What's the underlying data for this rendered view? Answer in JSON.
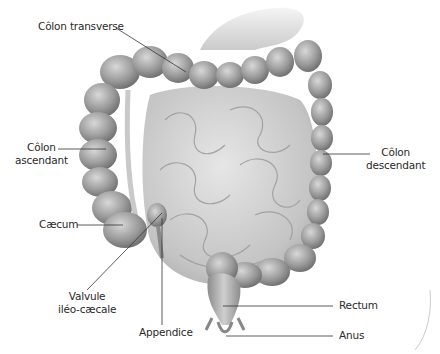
{
  "diagram": {
    "labels": {
      "colon_transverse": "Côlon transverse",
      "colon_ascendant_1": "Côlon",
      "colon_ascendant_2": "ascendant",
      "colon_descendant_1": "Côlon",
      "colon_descendant_2": "descendant",
      "caecum": "Cæcum",
      "valvule_1": "Valvule",
      "valvule_2": "iléo-cæcale",
      "appendice": "Appendice",
      "rectum": "Rectum",
      "anus": "Anus"
    },
    "colors": {
      "background": "#ffffff",
      "organ_dark": "#7a7a7a",
      "organ_mid": "#a8a8a8",
      "organ_light": "#d4d4d4",
      "leader_line": "#333333",
      "label_text": "#2a2a2a"
    }
  }
}
